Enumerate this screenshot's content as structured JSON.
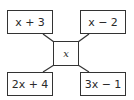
{
  "diagram": {
    "type": "connected-boxes",
    "center": {
      "label": "x"
    },
    "corners": {
      "top_left": {
        "label": "x + 3"
      },
      "top_right": {
        "label": "x − 2"
      },
      "bottom_left": {
        "label": "2x + 4"
      },
      "bottom_right": {
        "label": "3x − 1"
      }
    },
    "colors": {
      "stroke": "#333333",
      "text": "#2a2a2a",
      "background": "#ffffff"
    }
  }
}
